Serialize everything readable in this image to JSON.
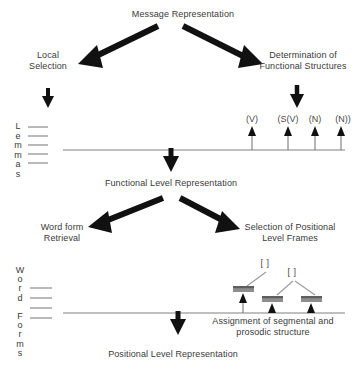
{
  "diagram": {
    "title": "Message Representation",
    "levels": {
      "functional": "Functional Level Representation",
      "positional": "Positional Level Representation"
    },
    "branches": {
      "local_selection": "Local\nSelection",
      "determination": "Determination of\nFunctional Structures",
      "word_form_retrieval": "Word form\nRetrieval",
      "positional_frames": "Selection of Positional\nLevel Frames",
      "assignment": "Assignment of segmental and\nprosodic structure"
    },
    "stripes": {
      "lemmas": "L\ne\nm\nm\na\ns",
      "word_forms": "W\no\nr\nd\n\nF\no\nr\nm\ns"
    },
    "functional_tier": {
      "ticks": [
        {
          "label": "(V)",
          "x": 252
        },
        {
          "label": "(S(V)",
          "x": 288
        },
        {
          "label": "(N)",
          "x": 315
        },
        {
          "label": "(N))",
          "x": 341
        }
      ]
    },
    "positional_tier": {
      "brackets": [
        {
          "label": "[ ]",
          "x": 264,
          "y": 262
        },
        {
          "label": "[ ]",
          "x": 291,
          "y": 271
        }
      ],
      "slots": [
        {
          "x": 243,
          "y": 287
        },
        {
          "x": 272,
          "y": 297
        },
        {
          "x": 311,
          "y": 297
        }
      ]
    },
    "colors": {
      "ink": "#2b2b2b",
      "text": "#3a3a3a",
      "rule": "#808080",
      "slot": "#8a8a8a",
      "slot_top": "#5e5e5e",
      "thin": "#6e6e6e"
    }
  }
}
